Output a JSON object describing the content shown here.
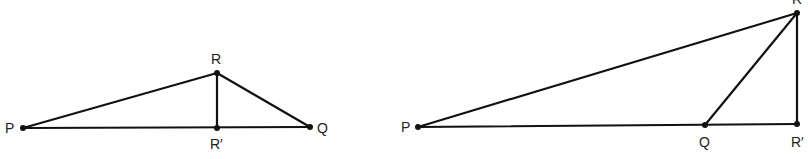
{
  "diagrams": [
    {
      "id": "left",
      "description": "Acute-at-base triangle PQR with foot of altitude R' between P and Q",
      "points": {
        "P": {
          "x": 23,
          "y": 128,
          "label": "P",
          "lx": 5,
          "ly": 133
        },
        "R": {
          "x": 217,
          "y": 73,
          "label": "R",
          "lx": 211,
          "ly": 64
        },
        "Rp": {
          "x": 217,
          "y": 128,
          "label": "R′",
          "lx": 210,
          "ly": 149
        },
        "Q": {
          "x": 310,
          "y": 127,
          "label": "Q",
          "lx": 317,
          "ly": 133
        }
      },
      "segments": [
        [
          "P",
          "R"
        ],
        [
          "R",
          "Q"
        ],
        [
          "P",
          "Q"
        ],
        [
          "R",
          "Rp"
        ]
      ]
    },
    {
      "id": "right",
      "description": "Obtuse triangle PQR with foot of altitude R' beyond Q",
      "points": {
        "P": {
          "x": 418,
          "y": 127,
          "label": "P",
          "lx": 401,
          "ly": 132
        },
        "Q": {
          "x": 705,
          "y": 125,
          "label": "Q",
          "lx": 699,
          "ly": 147
        },
        "R": {
          "x": 797,
          "y": 13,
          "label": "R",
          "lx": 792,
          "ly": 4
        },
        "Rp": {
          "x": 797,
          "y": 124,
          "label": "R′",
          "lx": 791,
          "ly": 147
        }
      },
      "segments": [
        [
          "P",
          "R"
        ],
        [
          "Q",
          "R"
        ],
        [
          "P",
          "Rp"
        ],
        [
          "R",
          "Rp"
        ]
      ]
    }
  ]
}
